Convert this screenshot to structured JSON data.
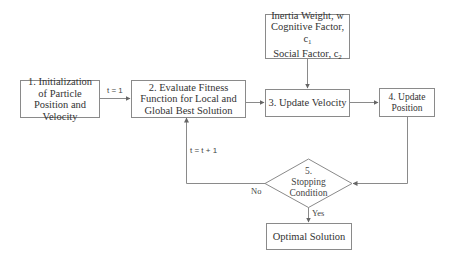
{
  "diagram": {
    "type": "flowchart",
    "nodes": {
      "init": {
        "label": "1. Initialization of Particle Position and Velocity"
      },
      "evaluate": {
        "label": "2. Evaluate Fitness Function for Local and Global Best Solution"
      },
      "params": {
        "line1": "Inertia Weight, w",
        "line2_text": "Cognitive Factor, c",
        "line2_sub": "1",
        "line3_text": "Social Factor, c",
        "line3_sub": "2"
      },
      "velocity": {
        "label": "3. Update Velocity"
      },
      "position": {
        "label": "4. Update Position"
      },
      "stopping": {
        "line1": "5.",
        "line2": "Stopping",
        "line3": "Condition"
      },
      "optimal": {
        "label": "Optimal Solution"
      }
    },
    "edge_labels": {
      "t_init": "t = 1",
      "t_increment": "t = t + 1",
      "no": "No",
      "yes": "Yes"
    },
    "edges": [
      {
        "from": "init",
        "to": "evaluate",
        "label": "t = 1"
      },
      {
        "from": "evaluate",
        "to": "velocity"
      },
      {
        "from": "params",
        "to": "velocity"
      },
      {
        "from": "velocity",
        "to": "position"
      },
      {
        "from": "position",
        "to": "stopping"
      },
      {
        "from": "stopping",
        "to": "evaluate",
        "label": "No / t = t + 1"
      },
      {
        "from": "stopping",
        "to": "optimal",
        "label": "Yes"
      }
    ],
    "colors": {
      "stroke": "#8a8a8a",
      "text": "#333333",
      "background": "#ffffff"
    }
  }
}
